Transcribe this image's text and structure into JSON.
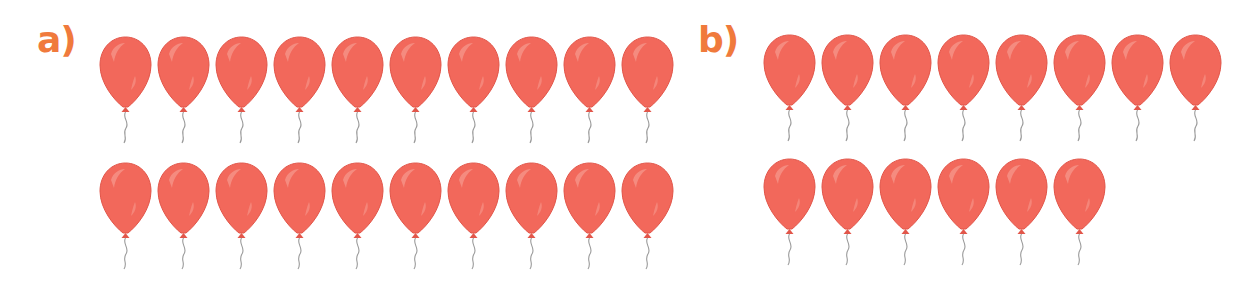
{
  "colors": {
    "balloon": "#f2685b",
    "balloon_dark": "#e2564a",
    "highlight": "#f79a8e",
    "label": "#f07a3c",
    "string": "#9a9a9a"
  },
  "groups": [
    {
      "label": "a)",
      "rows": [
        10,
        10
      ],
      "total": 20
    },
    {
      "label": "b)",
      "rows": [
        8,
        6
      ],
      "total": 14
    }
  ]
}
